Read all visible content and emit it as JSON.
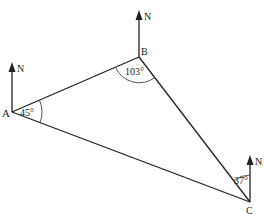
{
  "diagram": {
    "type": "bearing-triangle",
    "points": {
      "A": {
        "label": "A",
        "x": 12,
        "y": 112
      },
      "B": {
        "label": "B",
        "x": 139,
        "y": 57
      },
      "C": {
        "label": "C",
        "x": 250,
        "y": 202
      }
    },
    "north_label": "N",
    "angles": {
      "A": "45°",
      "B": "103°",
      "C": "37°"
    },
    "stroke_color": "#222222"
  }
}
